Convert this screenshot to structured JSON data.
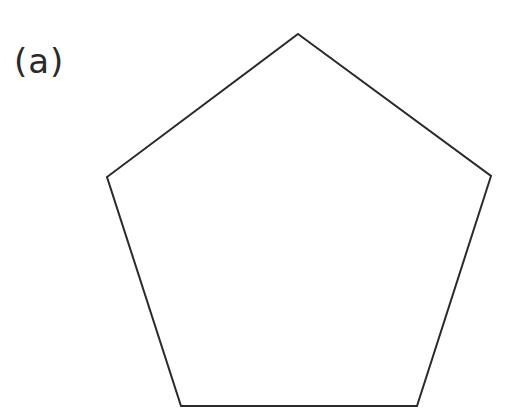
{
  "figure": {
    "label": "(a)",
    "shape": "pentagon",
    "stroke_color": "#2a2a2a",
    "fill_color": "#ffffff",
    "stroke_width": 2,
    "vertices": [
      [
        298,
        34
      ],
      [
        491,
        176
      ],
      [
        417,
        406
      ],
      [
        181,
        406
      ],
      [
        107,
        177
      ]
    ]
  }
}
